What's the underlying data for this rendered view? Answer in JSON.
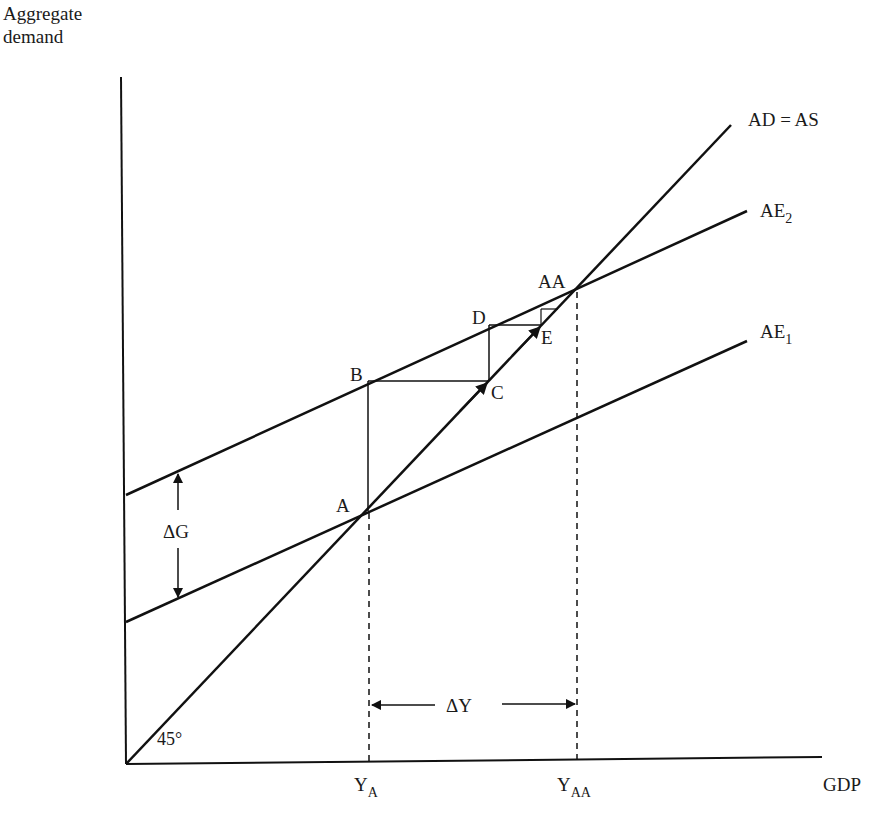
{
  "axes": {
    "y_label_line1": "Aggregate",
    "y_label_line2": "demand",
    "x_label": "GDP"
  },
  "lines": {
    "ad_as": "AD = AS",
    "ae2_base": "AE",
    "ae2_sub": "2",
    "ae1_base": "AE",
    "ae1_sub": "1"
  },
  "points": {
    "a": "A",
    "b": "B",
    "c": "C",
    "d": "D",
    "e": "E",
    "aa": "AA"
  },
  "annotations": {
    "delta_g": "ΔG",
    "delta_y": "ΔY",
    "angle": "45°",
    "ya_base": "Y",
    "ya_sub": "A",
    "yaa_base": "Y",
    "yaa_sub": "AA"
  },
  "colors": {
    "line": "#111111",
    "background": "#ffffff"
  }
}
